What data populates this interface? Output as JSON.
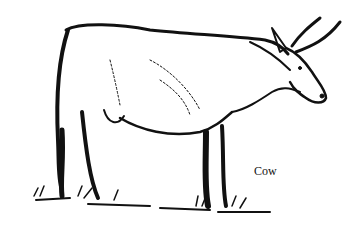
{
  "illustration": {
    "subject": "cow",
    "style": "black-and-white pen-and-ink drawing",
    "colors": {
      "ink": "#111111",
      "background": "#ffffff"
    }
  },
  "caption": {
    "text": "Cow"
  }
}
